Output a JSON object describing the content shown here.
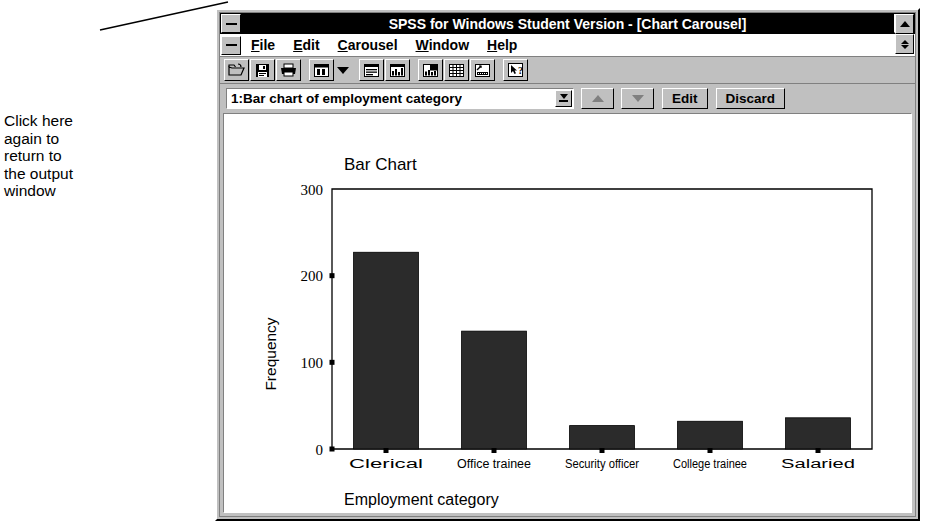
{
  "annotation": {
    "text": "Click here\nagain to\nreturn to\nthe output\nwindow"
  },
  "window": {
    "title": "SPSS for Windows Student Version - [Chart Carousel]",
    "system_menu_icon": "system-menu-icon",
    "minimize_icon": "minimize-icon",
    "maximize_icon": "maximize-icon",
    "doc_restore_icon": "restore-icon"
  },
  "menu": {
    "items": [
      {
        "label": "File",
        "accel": "F"
      },
      {
        "label": "Edit",
        "accel": "E"
      },
      {
        "label": "Carousel",
        "accel": "C"
      },
      {
        "label": "Window",
        "accel": "W"
      },
      {
        "label": "Help",
        "accel": "H"
      }
    ]
  },
  "toolbar": {
    "buttons": [
      {
        "icon": "open-folder-icon",
        "name": "open-file-button"
      },
      {
        "icon": "save-disk-icon",
        "name": "save-file-button"
      },
      {
        "icon": "printer-icon",
        "name": "print-button"
      },
      {
        "icon": "window-list-icon",
        "name": "designate-window-button"
      },
      {
        "icon": "chevron-down-icon",
        "name": "window-list-dropdown"
      },
      {
        "icon": "output-window-icon",
        "name": "go-to-output-button"
      },
      {
        "icon": "chart-window-icon",
        "name": "go-to-chart-carousel-button"
      },
      {
        "icon": "new-chart-icon",
        "name": "new-chart-button"
      },
      {
        "icon": "grid-icon",
        "name": "data-editor-button"
      },
      {
        "icon": "syntax-icon",
        "name": "syntax-window-button"
      },
      {
        "icon": "help-pointer-icon",
        "name": "context-help-button"
      }
    ]
  },
  "carousel": {
    "combo_value": "1:Bar chart of employment category",
    "dropdown_icon": "combo-arrow-icon",
    "prev_icon": "up-arrow-icon",
    "next_icon": "down-arrow-icon",
    "edit_label": "Edit",
    "discard_label": "Discard"
  },
  "chart_data": {
    "type": "bar",
    "title": "Bar Chart",
    "xlabel": "Employment category",
    "ylabel": "Frequency",
    "categories": [
      "Clerical",
      "Office  trainee",
      "Security officer",
      "College trainee",
      "Salaried"
    ],
    "values": [
      227,
      136,
      27,
      32,
      36
    ],
    "ylim": [
      0,
      300
    ],
    "yticks": [
      0,
      100,
      200,
      300
    ],
    "grid": false,
    "legend": "none",
    "bar_color": "#2b2b2b"
  },
  "colors": {
    "face": "#c0c0c0",
    "titlebar": "#000000",
    "titlebar_text": "#ffffff",
    "client": "#ffffff",
    "bar": "#2b2b2b",
    "axis": "#000000"
  }
}
